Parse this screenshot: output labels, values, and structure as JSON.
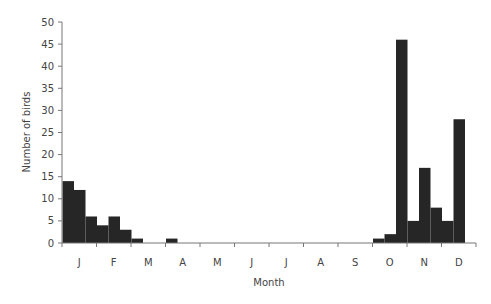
{
  "chart_data": {
    "type": "bar",
    "title": "",
    "xlabel": "Month",
    "ylabel": "Number of birds",
    "ylim": [
      0,
      50
    ],
    "yticks": [
      0,
      5,
      10,
      15,
      20,
      25,
      30,
      35,
      40,
      45,
      50
    ],
    "categories": [
      "J",
      "F",
      "M",
      "A",
      "M",
      "J",
      "J",
      "A",
      "S",
      "O",
      "N",
      "D"
    ],
    "bars_per_category": 3,
    "values": [
      [
        14,
        12,
        6
      ],
      [
        4,
        6,
        3
      ],
      [
        1,
        0,
        0
      ],
      [
        1,
        0,
        0
      ],
      [
        0,
        0,
        0
      ],
      [
        0,
        0,
        0
      ],
      [
        0,
        0,
        0
      ],
      [
        0,
        0,
        0
      ],
      [
        0,
        0,
        0
      ],
      [
        1,
        2,
        46
      ],
      [
        5,
        17,
        8
      ],
      [
        5,
        28,
        0
      ]
    ],
    "grid": false,
    "legend": null,
    "bar_color": "#262626"
  }
}
